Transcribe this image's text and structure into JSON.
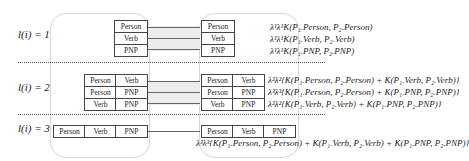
{
  "rows": [
    {
      "label": "l(i) = 1",
      "left_cells": [
        [
          "Person"
        ],
        [
          "Verb"
        ],
        [
          "PNP"
        ]
      ],
      "right_cells": [
        [
          "Person"
        ],
        [
          "Verb"
        ],
        [
          "PNP"
        ]
      ],
      "formulas": [
        "λ¹λ¹K(P₁.Person, P₂.Person)",
        "λ¹λ¹K(P₁.Verb, P₂.Verb)",
        "λ¹λ¹K(P₁.PNP, P₂.PNP)"
      ]
    },
    {
      "label": "l(i) = 2",
      "left_cells": [
        [
          "Person",
          "Verb"
        ],
        [
          "Person",
          "PNP"
        ],
        [
          "Verb",
          "PNP"
        ]
      ],
      "right_cells": [
        [
          "Person",
          "Verb"
        ],
        [
          "Person",
          "PNP"
        ],
        [
          "Verb",
          "PNP"
        ]
      ],
      "formulas": [
        "λ²λ²{K(P₁.Person, P₂.Person) + K(P₁.Verb, P₂.Verb)}",
        "λ³λ³{K(P₁.Person, P₂.Person) + K(P₁.PNP, P₂.PNP)}",
        "λ²λ²{K(P₁.Verb, P₂.Verb) + K(P₁.PNP, P₂.PNP)}"
      ]
    },
    {
      "label": "l(i) = 3",
      "left_cells": [
        [
          "Person",
          "Verb",
          "PNP"
        ]
      ],
      "right_cells": [
        [
          "Person",
          "Verb",
          "PNP"
        ]
      ],
      "formulas": [
        "λ³λ³{K(P₁.Person, P₂.Person) + K(P₁.Verb, P₂.Verb) + K(P₁.PNP, P₂.PNP)}"
      ]
    }
  ]
}
